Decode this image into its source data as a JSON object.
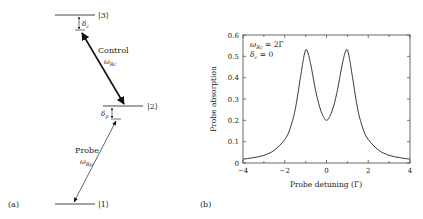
{
  "panel_a": {
    "label": "(a)",
    "levels": [
      {
        "name": "|3⟩",
        "y": 15,
        "x1": 55,
        "x2": 95
      },
      {
        "name": "|2⟩",
        "y": 106,
        "x1": 103,
        "x2": 143
      },
      {
        "name": "|1⟩",
        "y": 204,
        "x1": 55,
        "x2": 95
      }
    ],
    "control": {
      "title": "Control",
      "symbol": "ω",
      "subscript": "Rc"
    },
    "probe": {
      "title": "Probe",
      "symbol": "ω",
      "subscript": "Rp"
    },
    "detuning_c": {
      "symbol": "δ",
      "subscript": "c"
    },
    "detuning_p": {
      "symbol": "δ",
      "subscript": "p"
    }
  },
  "panel_b": {
    "label": "(b)",
    "annotation_line1": {
      "symbol": "ω",
      "subscript": "Rc",
      "rest": " = 2Γ"
    },
    "annotation_line2": {
      "symbol": "δ",
      "subscript": "c",
      "rest": " = 0"
    }
  },
  "chart_data": {
    "type": "line",
    "title": "",
    "xlabel": "Probe detuning (Γ)",
    "ylabel": "Probe absorption",
    "xlim": [
      -4,
      4
    ],
    "ylim": [
      0,
      0.6
    ],
    "xticks": [
      -4,
      -2,
      0,
      2,
      4
    ],
    "xtick_labels": [
      "−4",
      "−2",
      "0",
      "2",
      "4"
    ],
    "yticks": [
      0,
      0.1,
      0.2,
      0.3,
      0.4,
      0.5,
      0.6
    ],
    "ytick_labels": [
      "0",
      "0.1",
      "0.2",
      "0.3",
      "0.4",
      "0.5",
      "0.6"
    ],
    "grid": false,
    "legend": "none",
    "annotations": [
      "ω_Rc = 2Γ",
      "δ_c = 0"
    ],
    "series": [
      {
        "name": "Probe absorption",
        "x": [
          -4,
          -3.5,
          -3,
          -2.5,
          -2,
          -1.75,
          -1.5,
          -1.25,
          -1.1,
          -1,
          -0.9,
          -0.75,
          -0.5,
          -0.25,
          0,
          0.25,
          0.5,
          0.75,
          0.9,
          1,
          1.1,
          1.25,
          1.5,
          1.75,
          2,
          2.5,
          3,
          3.5,
          4
        ],
        "y": [
          0.018,
          0.025,
          0.036,
          0.06,
          0.11,
          0.16,
          0.25,
          0.4,
          0.49,
          0.53,
          0.52,
          0.46,
          0.33,
          0.24,
          0.2,
          0.24,
          0.33,
          0.46,
          0.52,
          0.53,
          0.49,
          0.4,
          0.25,
          0.16,
          0.11,
          0.06,
          0.036,
          0.025,
          0.018
        ]
      }
    ]
  }
}
